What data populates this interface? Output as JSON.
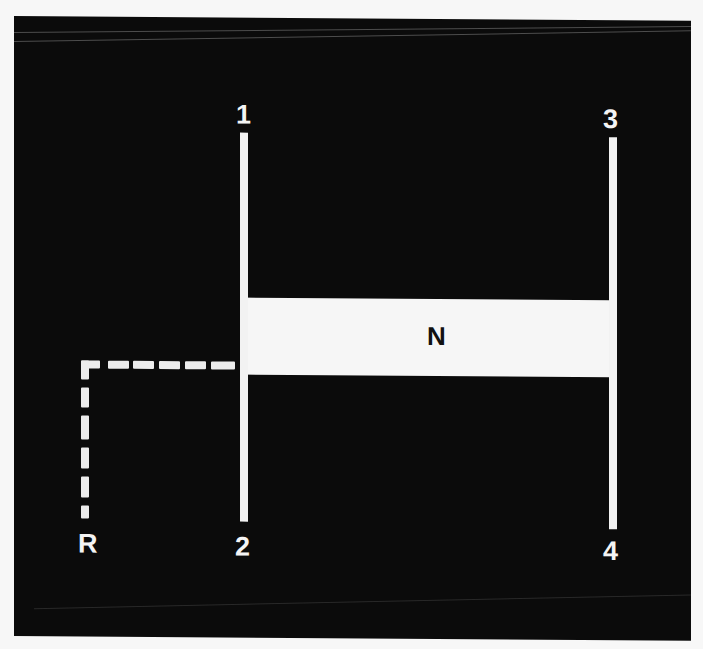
{
  "diagram": {
    "colors": {
      "background": "#0b0b0b",
      "lines": "#f2f2f2",
      "neutral_band": "#f6f6f6",
      "label_on_dark": "#f4f4f4",
      "label_on_light": "#111111",
      "page": "#f7f7f7"
    },
    "gears": [
      {
        "id": "gear-1",
        "label": "1"
      },
      {
        "id": "gear-2",
        "label": "2"
      },
      {
        "id": "gear-3",
        "label": "3"
      },
      {
        "id": "gear-4",
        "label": "4"
      },
      {
        "id": "reverse",
        "label": "R"
      }
    ],
    "neutral": {
      "label": "N"
    },
    "reverse_path_style": "dashed"
  }
}
